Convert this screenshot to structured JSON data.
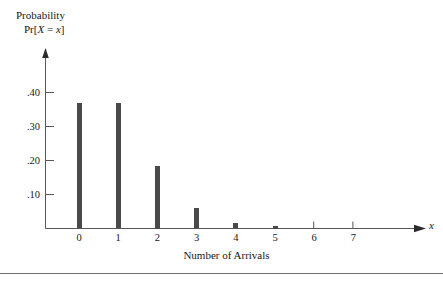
{
  "chart_data": {
    "type": "bar",
    "title": "",
    "ylabel_lines": [
      "Probability",
      "Pr[X = x]"
    ],
    "xlabel": "Number of Arrivals",
    "x_axis_variable": "x",
    "categories": [
      "0",
      "1",
      "2",
      "3",
      "4",
      "5",
      "6",
      "7"
    ],
    "values": [
      0.368,
      0.368,
      0.184,
      0.061,
      0.015,
      0.003,
      0.0,
      0.0
    ],
    "ytick_labels": [
      ".40",
      ".30",
      ".20",
      ".10"
    ],
    "ytick_values": [
      0.4,
      0.3,
      0.2,
      0.1
    ],
    "ylim": [
      0,
      0.47
    ],
    "xlim": [
      -0.85,
      9.0
    ],
    "grid": false,
    "legend": null,
    "bar_color": "#4a4a4d",
    "axis_color": "#58585b",
    "background_color": "#ffffff"
  },
  "axis": {
    "y_caption_line1": "Probability",
    "y_caption_line2_prefix": "Pr[",
    "y_caption_var1": "X",
    "y_caption_eq": " = ",
    "y_caption_var2": "x",
    "y_caption_suffix": "]",
    "x_title": "Number of Arrivals",
    "x_variable": "x"
  },
  "ticks": {
    "y": [
      {
        "label": ".40",
        "value": 0.4
      },
      {
        "label": ".30",
        "value": 0.3
      },
      {
        "label": ".20",
        "value": 0.2
      },
      {
        "label": ".10",
        "value": 0.1
      }
    ],
    "x": [
      {
        "label": "0",
        "value": 0
      },
      {
        "label": "1",
        "value": 1
      },
      {
        "label": "2",
        "value": 2
      },
      {
        "label": "3",
        "value": 3
      },
      {
        "label": "4",
        "value": 4
      },
      {
        "label": "5",
        "value": 5
      },
      {
        "label": "6",
        "value": 6
      },
      {
        "label": "7",
        "value": 7
      }
    ]
  }
}
